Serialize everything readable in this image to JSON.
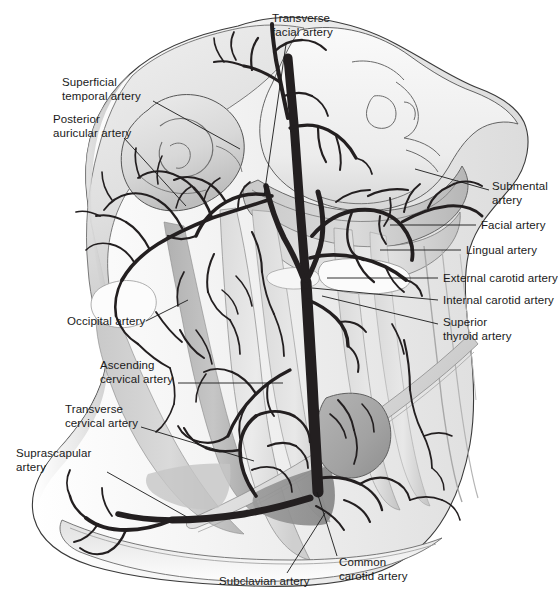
{
  "figure": {
    "type": "anatomical-illustration",
    "view": "lateral right side of head and neck",
    "style": "grayscale line and tone drawing",
    "background_color": "#ffffff",
    "artery_color": "#231f20",
    "tissue_tones": [
      "#f2f2f2",
      "#e3e3e3",
      "#d2d2d2",
      "#c0c0c0",
      "#ababab",
      "#949494"
    ],
    "label_color": "#1a1a1a",
    "leader_color": "#1a1a1a"
  },
  "labels": [
    {
      "id": "transverse-facial-artery",
      "text": "Transverse\nfacial artery",
      "align": "left",
      "x": 272,
      "y": 12,
      "leader": [
        [
          286,
          44
        ],
        [
          264,
          196
        ]
      ]
    },
    {
      "id": "superficial-temporal-artery",
      "text": "Superficial\ntemporal artery",
      "align": "right",
      "x": 62,
      "y": 76,
      "leader": [
        [
          153,
          101
        ],
        [
          240,
          149
        ]
      ]
    },
    {
      "id": "posterior-auricular-artery",
      "text": "Posterior\nauricular artery",
      "align": "right",
      "x": 53,
      "y": 113,
      "leader": [
        [
          124,
          138
        ],
        [
          186,
          206
        ]
      ]
    },
    {
      "id": "submental-artery",
      "text": "Submental\nartery",
      "align": "left",
      "x": 492,
      "y": 180,
      "leader": [
        [
          489,
          190
        ],
        [
          415,
          169
        ]
      ]
    },
    {
      "id": "facial-artery",
      "text": "Facial artery",
      "align": "left",
      "x": 481,
      "y": 219,
      "leader": [
        [
          476,
          225
        ],
        [
          390,
          225
        ]
      ]
    },
    {
      "id": "lingual-artery",
      "text": "Lingual artery",
      "align": "left",
      "x": 466,
      "y": 244,
      "leader": [
        [
          461,
          250
        ],
        [
          380,
          250
        ]
      ]
    },
    {
      "id": "external-carotid-artery",
      "text": "External carotid artery",
      "align": "left",
      "x": 443,
      "y": 272,
      "leader": [
        [
          438,
          278
        ],
        [
          327,
          278
        ]
      ]
    },
    {
      "id": "internal-carotid-artery",
      "text": "Internal carotid artery",
      "align": "left",
      "x": 443,
      "y": 294,
      "leader": [
        [
          438,
          300
        ],
        [
          312,
          288
        ]
      ]
    },
    {
      "id": "superior-thyroid-artery",
      "text": "Superior\nthyroid artery",
      "align": "left",
      "x": 443,
      "y": 316,
      "leader": [
        [
          438,
          324
        ],
        [
          322,
          296
        ]
      ]
    },
    {
      "id": "occipital-artery",
      "text": "Occipital artery",
      "align": "right",
      "x": 67,
      "y": 315,
      "leader": [
        [
          146,
          321
        ],
        [
          188,
          300
        ]
      ]
    },
    {
      "id": "ascending-cervical-artery",
      "text": "Ascending\ncervical artery",
      "align": "right",
      "x": 100,
      "y": 359,
      "leader": [
        [
          178,
          383
        ],
        [
          283,
          383
        ]
      ]
    },
    {
      "id": "transverse-cervical-artery",
      "text": "Transverse\ncervical artery",
      "align": "right",
      "x": 65,
      "y": 403,
      "leader": [
        [
          141,
          427
        ],
        [
          254,
          461
        ]
      ]
    },
    {
      "id": "suprascapular-artery",
      "text": "Suprascapular\nartery",
      "align": "right",
      "x": 16,
      "y": 447,
      "leader": [
        [
          107,
          472
        ],
        [
          187,
          517
        ]
      ]
    },
    {
      "id": "subclavian-artery",
      "text": "Subclavian artery",
      "align": "left",
      "x": 219,
      "y": 575,
      "leader": [
        [
          287,
          573
        ],
        [
          325,
          513
        ]
      ]
    },
    {
      "id": "common-carotid-artery",
      "text": "Common\ncarotid artery",
      "align": "left",
      "x": 339,
      "y": 556,
      "leader": [
        [
          337,
          556
        ],
        [
          317,
          492
        ]
      ]
    }
  ]
}
